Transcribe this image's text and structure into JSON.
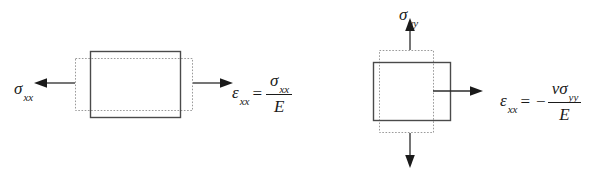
{
  "figure": {
    "width": 592,
    "height": 178,
    "background_color": "#ffffff",
    "line_color": "#4a4a4a",
    "dashed_color": "#9a9a9a",
    "text_color": "#1a1a1a"
  },
  "panels": [
    {
      "id": "axial",
      "name": "axial-stress-panel",
      "stress_label": {
        "symbol": "σ",
        "subscript": "xx"
      },
      "arrow_left_name": "sigma-xx-arrow-left",
      "arrow_right_name": "sigma-xx-arrow-right",
      "solid_rect_name": "undeformed-element",
      "dashed_rect_name": "deformed-element",
      "equation": {
        "lhs_symbol": "ε",
        "lhs_subscript": "xx",
        "equals": "=",
        "sign": "",
        "numerator_symbol": "σ",
        "numerator_subscript": "xx",
        "denominator": "E"
      }
    },
    {
      "id": "poisson",
      "name": "poisson-effect-panel",
      "stress_label": {
        "symbol": "σ",
        "subscript": "yy"
      },
      "arrow_up_name": "sigma-yy-arrow-up",
      "arrow_down_name": "sigma-yy-arrow-down",
      "arrow_right_name": "strain-xx-arrow-right",
      "solid_rect_name": "undeformed-element",
      "dashed_rect_name": "deformed-element",
      "equation": {
        "lhs_symbol": "ε",
        "lhs_subscript": "xx",
        "equals": "=",
        "sign": "−",
        "numerator_nu": "ν",
        "numerator_symbol": "σ",
        "numerator_subscript": "yy",
        "denominator": "E"
      }
    }
  ]
}
